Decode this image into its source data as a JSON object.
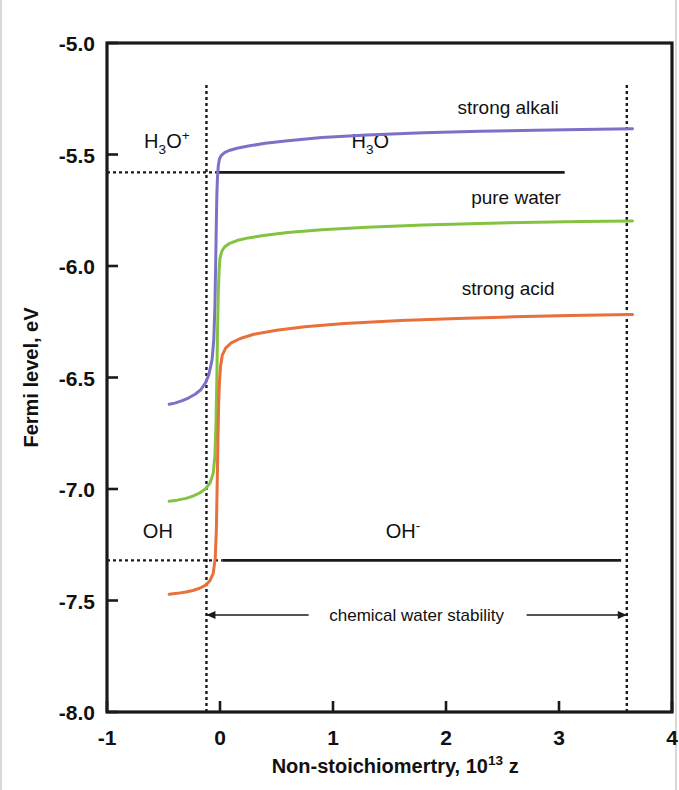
{
  "chart_data": {
    "type": "line",
    "title": "",
    "xlabel": "Non-stoichiomertry, 10^13 z",
    "xlabel_main": "Non-stoichiomertry, 10",
    "xlabel_exp": "13",
    "xlabel_var": "z",
    "ylabel": "Fermi level, eV",
    "xlim": [
      -1,
      4
    ],
    "ylim": [
      -8.0,
      -5.0
    ],
    "xticks": [
      -1,
      0,
      1,
      2,
      3,
      4
    ],
    "xtick_labels": [
      "-1",
      "0",
      "1",
      "2",
      "3",
      "4"
    ],
    "yticks": [
      -5.0,
      -5.5,
      -6.0,
      -6.5,
      -7.0,
      -7.5,
      -8.0
    ],
    "ytick_labels": [
      "-5.0",
      "-5.5",
      "-6.0",
      "-6.5",
      "-7.0",
      "-7.5",
      "-8.0"
    ],
    "grid": false,
    "legend_position": "inline-labels",
    "series": [
      {
        "name": "strong alkali",
        "color": "#7b72c8",
        "label": "strong alkali",
        "label_x": 2.55,
        "label_y": -5.32,
        "points": [
          [
            -0.45,
            -6.62
          ],
          [
            -0.4,
            -6.615
          ],
          [
            -0.34,
            -6.605
          ],
          [
            -0.28,
            -6.592
          ],
          [
            -0.22,
            -6.575
          ],
          [
            -0.17,
            -6.555
          ],
          [
            -0.13,
            -6.525
          ],
          [
            -0.1,
            -6.49
          ],
          [
            -0.07,
            -6.42
          ],
          [
            -0.055,
            -6.33
          ],
          [
            -0.045,
            -6.18
          ],
          [
            -0.038,
            -5.98
          ],
          [
            -0.032,
            -5.8
          ],
          [
            -0.028,
            -5.68
          ],
          [
            -0.022,
            -5.6
          ],
          [
            -0.015,
            -5.55
          ],
          [
            -0.005,
            -5.52
          ],
          [
            0.01,
            -5.505
          ],
          [
            0.04,
            -5.492
          ],
          [
            0.08,
            -5.482
          ],
          [
            0.15,
            -5.472
          ],
          [
            0.25,
            -5.462
          ],
          [
            0.4,
            -5.45
          ],
          [
            0.6,
            -5.438
          ],
          [
            0.9,
            -5.424
          ],
          [
            1.3,
            -5.412
          ],
          [
            1.8,
            -5.402
          ],
          [
            2.3,
            -5.396
          ],
          [
            2.8,
            -5.391
          ],
          [
            3.2,
            -5.388
          ],
          [
            3.65,
            -5.385
          ]
        ]
      },
      {
        "name": "pure water",
        "color": "#83c341",
        "label": "pure water",
        "label_x": 2.62,
        "label_y": -5.72,
        "points": [
          [
            -0.45,
            -7.055
          ],
          [
            -0.38,
            -7.05
          ],
          [
            -0.3,
            -7.042
          ],
          [
            -0.24,
            -7.032
          ],
          [
            -0.18,
            -7.018
          ],
          [
            -0.13,
            -7.0
          ],
          [
            -0.09,
            -6.975
          ],
          [
            -0.06,
            -6.93
          ],
          [
            -0.045,
            -6.85
          ],
          [
            -0.035,
            -6.7
          ],
          [
            -0.028,
            -6.5
          ],
          [
            -0.022,
            -6.3
          ],
          [
            -0.015,
            -6.12
          ],
          [
            -0.008,
            -6.02
          ],
          [
            0.0,
            -5.965
          ],
          [
            0.015,
            -5.935
          ],
          [
            0.04,
            -5.915
          ],
          [
            0.08,
            -5.9
          ],
          [
            0.15,
            -5.886
          ],
          [
            0.25,
            -5.874
          ],
          [
            0.4,
            -5.862
          ],
          [
            0.6,
            -5.85
          ],
          [
            0.9,
            -5.838
          ],
          [
            1.3,
            -5.826
          ],
          [
            1.8,
            -5.816
          ],
          [
            2.3,
            -5.809
          ],
          [
            2.8,
            -5.804
          ],
          [
            3.2,
            -5.801
          ],
          [
            3.65,
            -5.798
          ]
        ]
      },
      {
        "name": "strong acid",
        "color": "#e8703a",
        "label": "strong acid",
        "label_x": 2.55,
        "label_y": -6.13,
        "points": [
          [
            -0.45,
            -7.472
          ],
          [
            -0.38,
            -7.468
          ],
          [
            -0.3,
            -7.462
          ],
          [
            -0.24,
            -7.455
          ],
          [
            -0.18,
            -7.445
          ],
          [
            -0.13,
            -7.432
          ],
          [
            -0.09,
            -7.412
          ],
          [
            -0.06,
            -7.378
          ],
          [
            -0.042,
            -7.31
          ],
          [
            -0.032,
            -7.18
          ],
          [
            -0.025,
            -6.98
          ],
          [
            -0.018,
            -6.78
          ],
          [
            -0.012,
            -6.62
          ],
          [
            -0.005,
            -6.52
          ],
          [
            0.005,
            -6.45
          ],
          [
            0.02,
            -6.4
          ],
          [
            0.05,
            -6.368
          ],
          [
            0.1,
            -6.345
          ],
          [
            0.18,
            -6.325
          ],
          [
            0.3,
            -6.306
          ],
          [
            0.5,
            -6.288
          ],
          [
            0.75,
            -6.272
          ],
          [
            1.1,
            -6.258
          ],
          [
            1.6,
            -6.244
          ],
          [
            2.1,
            -6.235
          ],
          [
            2.6,
            -6.228
          ],
          [
            3.1,
            -6.222
          ],
          [
            3.65,
            -6.218
          ]
        ]
      }
    ],
    "reference_levels": [
      {
        "name": "h3o-level",
        "value": -5.58,
        "left_label": "H3O+",
        "left_label_main": "H",
        "left_label_sub": "3",
        "left_label_rest": "O",
        "left_label_sup": "+",
        "right_label_main": "H",
        "right_label_sub": "3",
        "right_label_rest": "O",
        "right_label_sup": "",
        "solid_from": -0.02,
        "solid_to": 3.05,
        "dotted_from": -1.0,
        "dotted_to": -0.02
      },
      {
        "name": "oh-level",
        "value": -7.32,
        "left_label_main": "O",
        "left_label_rest": "H",
        "left_label_sup": "",
        "right_label_main": "O",
        "right_label_rest": "H",
        "right_label_sup": "-",
        "solid_from": 0.02,
        "solid_to": 3.55,
        "dotted_from": -1.0,
        "dotted_to": 0.02
      }
    ],
    "vertical_markers": [
      {
        "name": "left-stability-boundary",
        "x": -0.12
      },
      {
        "name": "right-stability-boundary",
        "x": 3.6
      }
    ],
    "annotations": [
      {
        "name": "chemical-water-stability",
        "text": "chemical water stability",
        "x_from": -0.12,
        "x_to": 3.6,
        "y": -7.565
      }
    ]
  }
}
